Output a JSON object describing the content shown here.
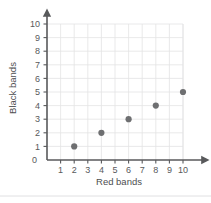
{
  "chart_data": {
    "type": "scatter",
    "title": "",
    "xlabel": "Red bands",
    "ylabel": "Black bands",
    "xlim": [
      0,
      10
    ],
    "ylim": [
      0,
      10
    ],
    "xticks": [
      0,
      1,
      2,
      3,
      4,
      5,
      6,
      7,
      8,
      9,
      10
    ],
    "yticks": [
      0,
      1,
      2,
      3,
      4,
      5,
      6,
      7,
      8,
      9,
      10
    ],
    "xtick_labels": [
      "1",
      "2",
      "3",
      "4",
      "5",
      "6",
      "7",
      "8",
      "9",
      "10"
    ],
    "ytick_labels": [
      "0",
      "1",
      "2",
      "3",
      "4",
      "5",
      "6",
      "7",
      "8",
      "9",
      "10"
    ],
    "origin_label": "0",
    "grid": true,
    "legend": false,
    "legend_position": "none",
    "marker_color": "#6e6f71",
    "grid_color": "#e3e3e5",
    "axis_color": "#58595b",
    "axis_arrows": true,
    "series": [
      {
        "name": "bands",
        "points": [
          {
            "x": 2,
            "y": 1
          },
          {
            "x": 4,
            "y": 2
          },
          {
            "x": 6,
            "y": 3
          },
          {
            "x": 8,
            "y": 4
          },
          {
            "x": 10,
            "y": 5
          }
        ]
      }
    ]
  }
}
